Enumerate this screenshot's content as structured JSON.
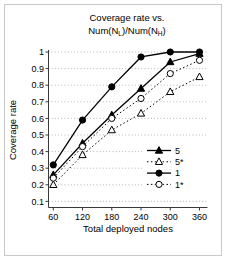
{
  "frame": {
    "border_color": "#c9c9c9",
    "background": "#ffffff"
  },
  "chart_data": {
    "type": "line",
    "title": {
      "line1": "Coverage rate vs.",
      "line2_parts": {
        "p0": "Num(N",
        "sub0": "L",
        "p1": ")/Num(N",
        "sub1": "H",
        "p2": ")"
      },
      "line2_plain": "Num(NL)/Num(NH)"
    },
    "xlabel": "Total deployed nodes",
    "ylabel": "Coverage rate",
    "x": [
      60,
      120,
      180,
      240,
      300,
      360
    ],
    "x_tick_labels": [
      "60",
      "120",
      "180",
      "240",
      "300",
      "360"
    ],
    "y_tick_labels": [
      "1",
      "0.9",
      "0.8",
      "0.7",
      "0.6",
      "0.5",
      "0.4",
      "0.3",
      "0.2",
      "0.1"
    ],
    "y_tick_values": [
      1.0,
      0.9,
      0.8,
      0.7,
      0.6,
      0.5,
      0.4,
      0.3,
      0.2,
      0.1
    ],
    "ylim": [
      0.1,
      1.0
    ],
    "grid": "horizontal-dotted",
    "legend_position": "inside-right",
    "legend_order": [
      "5",
      "5*",
      "1",
      "1*"
    ],
    "series": [
      {
        "name": "5",
        "marker": "filled-triangle",
        "line": "solid",
        "color": "#000000",
        "values": [
          0.26,
          0.45,
          0.62,
          0.78,
          0.94,
          0.99
        ]
      },
      {
        "name": "5*",
        "marker": "open-triangle",
        "line": "dotted",
        "color": "#000000",
        "values": [
          0.2,
          0.38,
          0.53,
          0.63,
          0.76,
          0.85
        ]
      },
      {
        "name": "1",
        "marker": "filled-circle",
        "line": "solid",
        "color": "#000000",
        "values": [
          0.32,
          0.59,
          0.79,
          0.97,
          1.0,
          1.0
        ]
      },
      {
        "name": "1*",
        "marker": "open-circle",
        "line": "dotted",
        "color": "#000000",
        "values": [
          0.24,
          0.43,
          0.6,
          0.72,
          0.87,
          0.95
        ]
      }
    ],
    "colors": {
      "series": "#000000",
      "gridline": "#b8b8b8",
      "axis": "#3a3a3a"
    }
  }
}
